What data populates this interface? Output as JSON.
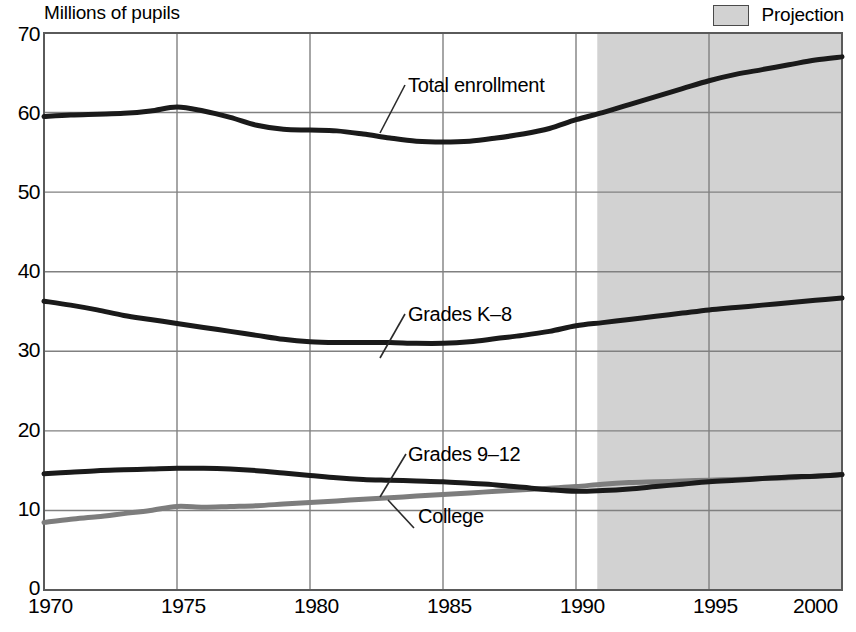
{
  "chart_data": {
    "type": "line",
    "title": "",
    "ylabel": "Millions of pupils",
    "xlabel": "",
    "ylim": [
      0,
      70
    ],
    "xlim": [
      1970,
      2000
    ],
    "yticks": [
      0,
      10,
      20,
      30,
      40,
      50,
      60,
      70
    ],
    "xticks": [
      1970,
      1975,
      1980,
      1985,
      1990,
      1995,
      2000
    ],
    "grid": true,
    "legend": [
      {
        "label": "Projection",
        "swatch_color": "#d2d2d2",
        "swatch_border": "#4a4a4a"
      }
    ],
    "annotations": [
      {
        "text": "Total enrollment",
        "series": "Total enrollment"
      },
      {
        "text": "Grades K–8",
        "series": "Grades K–8"
      },
      {
        "text": "Grades 9–12",
        "series": "Grades 9–12"
      },
      {
        "text": "College",
        "series": "College"
      }
    ],
    "projection": {
      "start_year": 1990.8,
      "end_year": 2000,
      "shade_color": "#d2d2d2"
    },
    "x": [
      1970,
      1971,
      1972,
      1973,
      1974,
      1975,
      1976,
      1977,
      1978,
      1979,
      1980,
      1981,
      1982,
      1983,
      1984,
      1985,
      1986,
      1987,
      1988,
      1989,
      1990,
      1991,
      1992,
      1993,
      1994,
      1995,
      1996,
      1997,
      1998,
      1999,
      2000
    ],
    "series": [
      {
        "name": "Total enrollment",
        "color": "#1a1a1a",
        "width": 5,
        "values": [
          59.5,
          59.7,
          59.8,
          59.9,
          60.2,
          60.7,
          60.2,
          59.4,
          58.4,
          57.9,
          57.8,
          57.7,
          57.3,
          56.8,
          56.4,
          56.3,
          56.4,
          56.8,
          57.3,
          58.0,
          59.1,
          60.0,
          61.0,
          62.0,
          63.0,
          64.0,
          64.8,
          65.4,
          66.0,
          66.6,
          67.0
        ]
      },
      {
        "name": "Grades K–8",
        "color": "#1a1a1a",
        "width": 5,
        "values": [
          36.3,
          35.8,
          35.2,
          34.5,
          34.0,
          33.5,
          33.0,
          32.5,
          32.0,
          31.5,
          31.2,
          31.1,
          31.1,
          31.1,
          31.0,
          31.0,
          31.2,
          31.6,
          32.0,
          32.5,
          33.2,
          33.6,
          34.0,
          34.4,
          34.8,
          35.2,
          35.5,
          35.8,
          36.1,
          36.4,
          36.7
        ]
      },
      {
        "name": "Grades 9–12",
        "color": "#1a1a1a",
        "width": 5,
        "values": [
          14.6,
          14.8,
          15.0,
          15.1,
          15.2,
          15.3,
          15.3,
          15.2,
          15.0,
          14.7,
          14.4,
          14.1,
          13.9,
          13.8,
          13.7,
          13.6,
          13.4,
          13.2,
          12.9,
          12.6,
          12.4,
          12.5,
          12.7,
          13.0,
          13.3,
          13.6,
          13.8,
          14.0,
          14.2,
          14.3,
          14.5
        ]
      },
      {
        "name": "College",
        "color": "#7d7d7d",
        "width": 5,
        "values": [
          8.5,
          8.9,
          9.2,
          9.6,
          10.0,
          10.5,
          10.4,
          10.5,
          10.6,
          10.8,
          11.0,
          11.2,
          11.4,
          11.6,
          11.8,
          12.0,
          12.2,
          12.4,
          12.6,
          12.8,
          13.0,
          13.3,
          13.5,
          13.6,
          13.7,
          13.8,
          13.9,
          14.0,
          14.1,
          14.3,
          14.5
        ]
      }
    ]
  },
  "axis_title": "Millions of pupils",
  "legend_label": "Projection",
  "yticks": [
    "70",
    "60",
    "50",
    "40",
    "30",
    "20",
    "10",
    "0"
  ],
  "xticks": [
    "1970",
    "1975",
    "1980",
    "1985",
    "1990",
    "1995",
    "2000"
  ],
  "labels": {
    "total": "Total enrollment",
    "k8": "Grades K–8",
    "g912": "Grades 9–12",
    "college": "College"
  }
}
